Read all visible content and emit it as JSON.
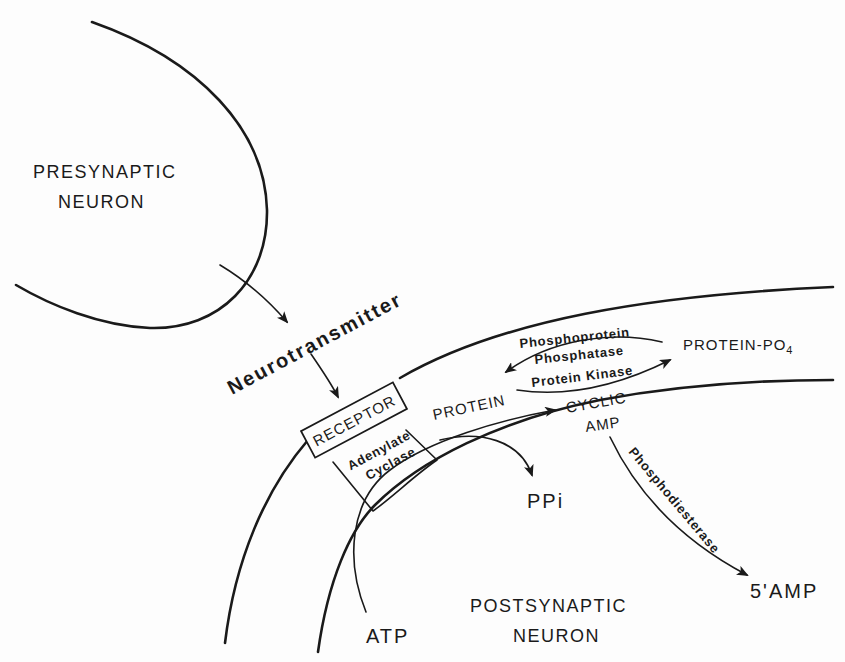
{
  "diagram": {
    "nodes": {
      "presynaptic_line1": "PRESYNAPTIC",
      "presynaptic_line2": "NEURON",
      "neurotransmitter": "Neurotransmitter",
      "receptor": "RECEPTOR",
      "adenylate_line1": "Adenylate",
      "adenylate_line2": "Cyclase",
      "protein": "PROTEIN",
      "protein_po4_main": "PROTEIN-PO",
      "protein_po4_sub": "4",
      "phosphoprotein_line1": "Phosphoprotein",
      "phosphoprotein_line2": "Phosphatase",
      "protein_kinase": "Protein Kinase",
      "cyclic": "CYCLIC",
      "amp": "AMP",
      "phosphodiesterase": "Phosphodiesterase",
      "five_amp": "5'AMP",
      "ppi": "PPi",
      "atp": "ATP",
      "postsynaptic_line1": "POSTSYNAPTIC",
      "postsynaptic_line2": "NEURON"
    },
    "edges": [
      {
        "from": "PRESYNAPTIC NEURON",
        "to": "Neurotransmitter"
      },
      {
        "from": "Neurotransmitter",
        "to": "RECEPTOR"
      },
      {
        "from": "ATP",
        "to": "CYCLIC AMP",
        "via": "Adenylate Cyclase"
      },
      {
        "from": "Adenylate Cyclase",
        "to": "PPi"
      },
      {
        "from": "PROTEIN",
        "to": "PROTEIN-PO4",
        "label": "Protein Kinase"
      },
      {
        "from": "PROTEIN-PO4",
        "to": "PROTEIN",
        "label": "Phosphoprotein Phosphatase"
      },
      {
        "from": "CYCLIC AMP",
        "to": "5'AMP",
        "label": "Phosphodiesterase"
      }
    ],
    "colors": {
      "ink": "#1a1a1a",
      "paper": "#fdfdfd"
    }
  }
}
